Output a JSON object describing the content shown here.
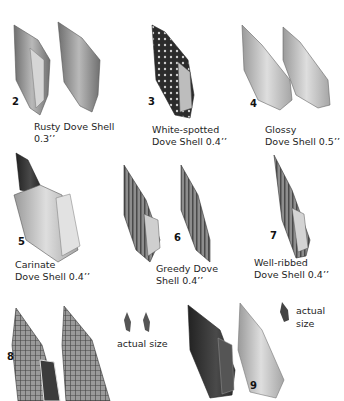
{
  "plate": {
    "specimens": [
      {
        "number": "2",
        "name_line1": "Rusty Dove Shell",
        "name_line2": "0.3’’"
      },
      {
        "number": "3",
        "name_line1": "White-spotted",
        "name_line2": "Dove Shell 0.4’’"
      },
      {
        "number": "4",
        "name_line1": "Glossy",
        "name_line2": "Dove Shell 0.5’’"
      },
      {
        "number": "5",
        "name_line1": "Carinate",
        "name_line2": "Dove Shell 0.4’’"
      },
      {
        "number": "6",
        "name_line1": "Greedy Dove",
        "name_line2": "Shell 0.4’’"
      },
      {
        "number": "7",
        "name_line1": "Well-ribbed",
        "name_line2": "Dove Shell 0.4’’"
      },
      {
        "number": "8",
        "note": "actual size"
      },
      {
        "number": "9",
        "note_line1": "actual",
        "note_line2": "size"
      }
    ],
    "colors": {
      "background": "#ffffff",
      "shell_dark": "#3a3a3a",
      "shell_mid": "#8a8a8a",
      "shell_light": "#cfcfcf",
      "text": "#1e1e1e"
    }
  }
}
